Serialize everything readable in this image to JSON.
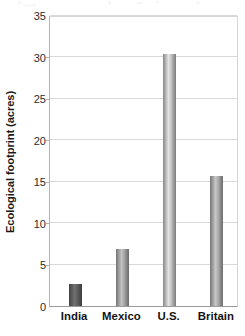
{
  "chart_data": {
    "type": "bar",
    "title": "",
    "xlabel": "",
    "ylabel": "Ecological footprint (acres)",
    "categories": [
      "India",
      "Mexico",
      "U.S.",
      "Britain"
    ],
    "values": [
      2.7,
      6.8,
      30.3,
      15.6
    ],
    "ylim": [
      0,
      35
    ],
    "ytick_values": [
      0,
      5,
      10,
      15,
      20,
      25,
      30,
      35
    ],
    "ytick_labels": [
      "0",
      "5",
      "10",
      "15",
      "20",
      "25",
      "30",
      "35"
    ],
    "grid": true,
    "grid_axis": "y",
    "legend": false,
    "legend_position": "none",
    "bar_style": "vertical-gradient-cylinder",
    "bar_colors": [
      "#595959",
      "#9a9a9a",
      "#b4b4b4",
      "#9e9e9e"
    ],
    "annotations": []
  },
  "axes": {
    "y_axis_title": "Ecological footprint (acres)",
    "y_min": "0",
    "y_max": "35"
  },
  "colors": {
    "plot_background": "#ffffff",
    "gridline": "#d9d9d9",
    "border": "#cfcfcf",
    "baseline": "#9a9a9a",
    "tick_text": "#2b2b2b",
    "label_text": "#141414"
  }
}
